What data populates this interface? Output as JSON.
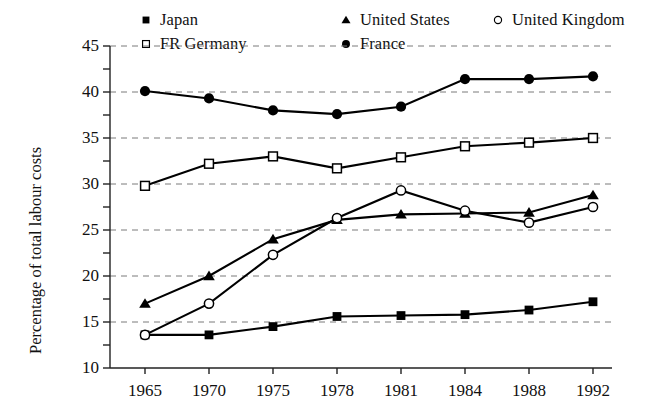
{
  "chart_data": {
    "type": "line",
    "title": "",
    "subtitle": "",
    "xlabel": "",
    "ylabel": "Percentage of total labour costs",
    "categories": [
      "1965",
      "1970",
      "1975",
      "1978",
      "1981",
      "1984",
      "1988",
      "1992"
    ],
    "ylim": [
      10,
      45
    ],
    "y_ticks": [
      10,
      15,
      20,
      25,
      30,
      35,
      40,
      45
    ],
    "y_tick_labels": [
      "10",
      "15",
      "20",
      "25",
      "30",
      "35",
      "40",
      "45"
    ],
    "y_minor_ticks": [
      12.5,
      17.5,
      22.5,
      27.5,
      32.5,
      37.5,
      42.5
    ],
    "grid": "horizontal-dashed",
    "legend_position": "top",
    "series": [
      {
        "name": "Japan",
        "marker": "filled-square",
        "color": "#000000",
        "values": [
          13.6,
          13.6,
          14.5,
          15.6,
          15.7,
          15.8,
          16.3,
          17.2
        ]
      },
      {
        "name": "United States",
        "marker": "filled-triangle",
        "color": "#000000",
        "values": [
          17.0,
          20.0,
          24.0,
          26.1,
          26.7,
          26.8,
          26.9,
          28.8
        ]
      },
      {
        "name": "United Kingdom",
        "marker": "open-circle",
        "color": "#000000",
        "values": [
          13.6,
          17.0,
          22.3,
          26.3,
          29.3,
          27.1,
          25.8,
          27.5
        ]
      },
      {
        "name": "FR Germany",
        "marker": "open-square",
        "color": "#000000",
        "values": [
          29.8,
          32.2,
          33.0,
          31.7,
          32.9,
          34.1,
          34.5,
          35.0
        ]
      },
      {
        "name": "France",
        "marker": "filled-circle",
        "color": "#000000",
        "values": [
          40.1,
          39.3,
          38.0,
          37.6,
          38.4,
          41.4,
          41.4,
          41.7
        ]
      }
    ]
  },
  "legend": {
    "rows": [
      [
        {
          "label": "Japan",
          "marker": "filled-square"
        },
        {
          "label": "United States",
          "marker": "filled-triangle"
        },
        {
          "label": "United Kingdom",
          "marker": "open-circle"
        }
      ],
      [
        {
          "label": "FR Germany",
          "marker": "open-square"
        },
        {
          "label": "France",
          "marker": "filled-circle"
        }
      ]
    ]
  },
  "axis": {
    "y_label": "Percentage of total labour costs"
  }
}
